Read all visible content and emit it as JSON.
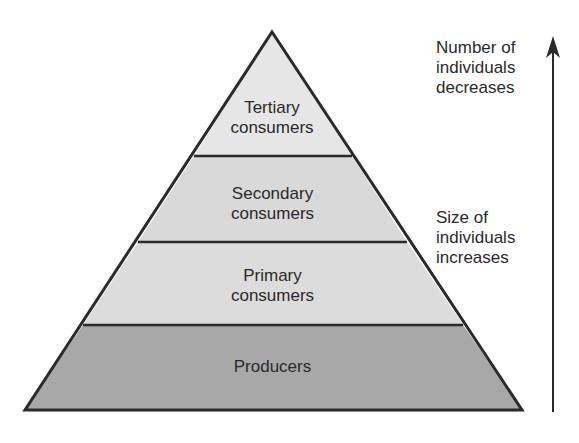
{
  "diagram": {
    "type": "ecological-pyramid",
    "levels": [
      {
        "name": "Tertiary consumers",
        "label": "Tertiary\nconsumers",
        "fill": "#e6e6e6"
      },
      {
        "name": "Secondary consumers",
        "label": "Secondary\nconsumers",
        "fill": "#d9d9d9"
      },
      {
        "name": "Primary consumers",
        "label": "Primary\nconsumers",
        "fill": "#dcdcdc"
      },
      {
        "name": "Producers",
        "label": "Producers",
        "fill": "#a8a8a8"
      }
    ],
    "annotations": {
      "top": "Number of\nindividuals\ndecreases",
      "middle": "Size of\nindividuals\nincreases"
    },
    "arrow": {
      "direction": "up"
    }
  }
}
